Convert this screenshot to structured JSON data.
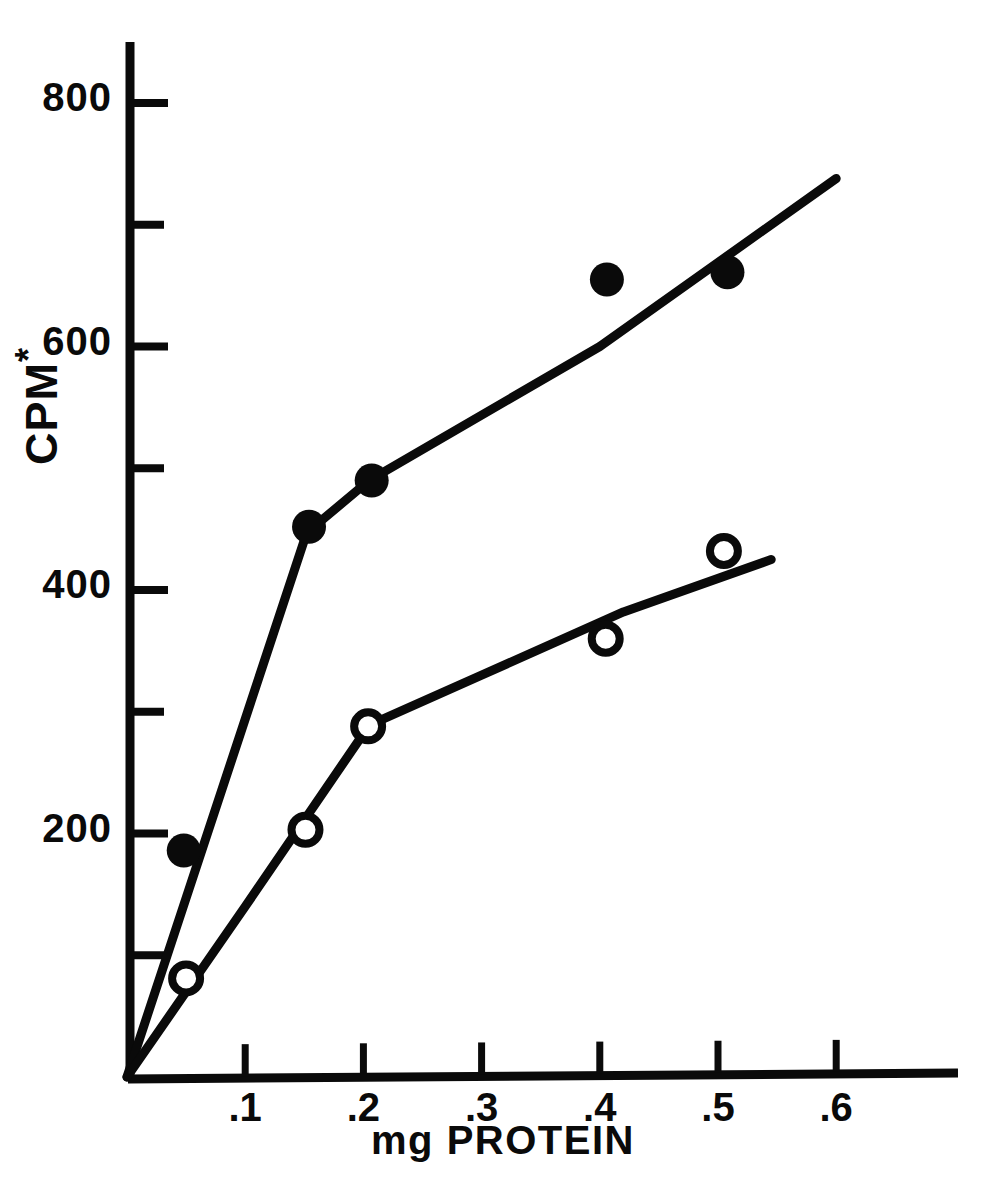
{
  "chart_data": {
    "type": "line",
    "title": "",
    "xlabel": "mg PROTEIN",
    "ylabel": "CPM*",
    "ylabel_base": "CPM",
    "ylabel_superscript": "*",
    "xlim": [
      0,
      0.72
    ],
    "ylim": [
      0,
      860
    ],
    "grid": false,
    "legend": "none",
    "x_major_ticks": [
      0.1,
      0.2,
      0.3,
      0.4,
      0.5,
      0.6
    ],
    "x_tick_labels": [
      ".1",
      ".2",
      ".3",
      ".4",
      ".5",
      ".6"
    ],
    "y_major_ticks": [
      200,
      400,
      600,
      800
    ],
    "y_tick_labels": [
      "200",
      "400",
      "600",
      "800"
    ],
    "y_minor_ticks": [
      100,
      300,
      500,
      700
    ],
    "series": [
      {
        "name": "filled-circles",
        "marker": "filled-circle",
        "color": "#0a0a0a",
        "x": [
          0.048,
          0.154,
          0.207,
          0.406,
          0.508
        ],
        "values": [
          186,
          452,
          490,
          655,
          661
        ],
        "fit_x": [
          0.0,
          0.152,
          0.205,
          0.4,
          0.6
        ],
        "fit_y": [
          0,
          447,
          490,
          600,
          738
        ]
      },
      {
        "name": "open-circles",
        "marker": "open-circle",
        "color": "#0a0a0a",
        "x": [
          0.05,
          0.151,
          0.204,
          0.405,
          0.505
        ],
        "values": [
          81,
          203,
          288,
          360,
          432
        ],
        "fit_x": [
          0.0,
          0.1,
          0.205,
          0.3,
          0.42,
          0.545
        ],
        "fit_y": [
          0,
          140,
          289,
          330,
          382,
          425
        ]
      }
    ]
  },
  "axes": {
    "y_axis_name": "y-axis",
    "x_axis_name": "x-axis"
  }
}
